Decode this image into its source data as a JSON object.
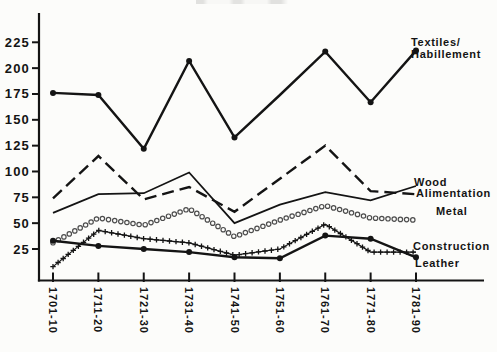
{
  "annotations": {
    "textiles_line1": "Textiles/",
    "textiles_line2": "Habillement",
    "wood": "Wood",
    "alimentation": "Alimentation",
    "metal": "Metal",
    "construction": "Construction",
    "leather": "Leather"
  },
  "chart_data": {
    "type": "line",
    "title": "",
    "xlabel": "",
    "ylabel": "",
    "grid": false,
    "legend_position": "inline-right-annotations",
    "x_labels_rotated_90": true,
    "ylim": [
      -5,
      240
    ],
    "y_ticks": [
      25,
      50,
      75,
      100,
      125,
      150,
      175,
      200,
      225
    ],
    "categories": [
      "1701-10",
      "1711-20",
      "1721-30",
      "1731-40",
      "1741-50",
      "1751-60",
      "1761-70",
      "1771-80",
      "1781-90"
    ],
    "series": [
      {
        "name": "Textiles/Habillement",
        "style": "solid-bold",
        "marker": "filled-dot",
        "marker_skip": [
          5
        ],
        "values": [
          176,
          174,
          122,
          207,
          133,
          174,
          216,
          167,
          217
        ]
      },
      {
        "name": "Alimentation",
        "style": "dashed",
        "marker": "none",
        "values": [
          74,
          115,
          73,
          85,
          61,
          93,
          125,
          81,
          78
        ]
      },
      {
        "name": "Wood",
        "style": "solid",
        "marker": "none",
        "values": [
          60,
          78,
          79,
          99,
          50,
          68,
          80,
          72,
          86
        ]
      },
      {
        "name": "Metal",
        "style": "open-circles",
        "marker": "circle-chain",
        "values": [
          31,
          55,
          48,
          64,
          37,
          53,
          67,
          55,
          53
        ]
      },
      {
        "name": "Construction",
        "style": "plus-chain",
        "marker": "plus-chain",
        "values": [
          8,
          43,
          35,
          31,
          19,
          25,
          49,
          22,
          22
        ]
      },
      {
        "name": "Leather",
        "style": "solid-bold",
        "marker": "filled-dot",
        "marker_skip": [],
        "values": [
          33,
          28,
          25,
          22,
          17,
          16,
          38,
          35,
          17
        ]
      }
    ]
  }
}
